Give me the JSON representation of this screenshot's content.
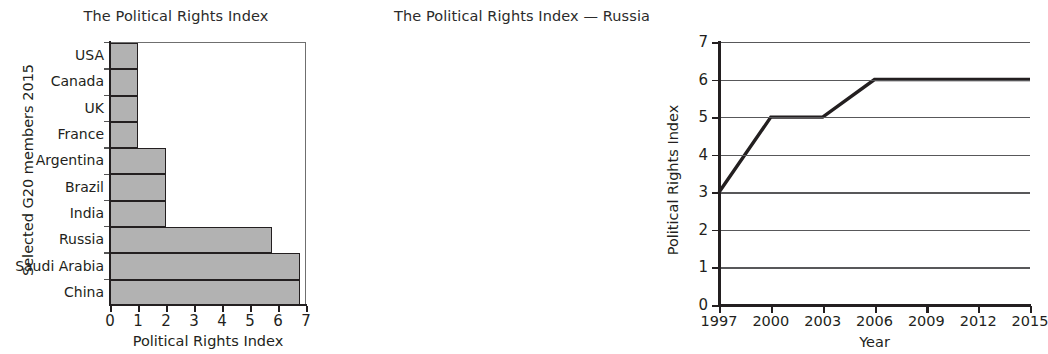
{
  "figure": {
    "background": "#ffffff",
    "ink_color": "#231f20",
    "bar_fill": "#b2b2b2",
    "gridline_color": "#58585a"
  },
  "chart_data": [
    {
      "type": "bar",
      "orientation": "horizontal",
      "title": "The Political Rights Index",
      "xlabel": "Political Rights Index",
      "ylabel": "Selected G20 members 2015",
      "categories": [
        "USA",
        "Canada",
        "UK",
        "France",
        "Argentina",
        "Brazil",
        "India",
        "Russia",
        "Saudi Arabia",
        "China"
      ],
      "values": [
        1,
        1,
        1,
        1,
        2,
        2,
        2,
        5.8,
        6.8,
        6.8
      ],
      "xlim": [
        0,
        7
      ],
      "xticks": [
        0,
        1,
        2,
        3,
        4,
        5,
        6,
        7
      ],
      "xtick_labels": [
        "0",
        "1",
        "2",
        "3",
        "4",
        "5",
        "6",
        "7"
      ],
      "grid": false,
      "legend": "none",
      "bar_fill_color": "#b2b2b2",
      "bar_edge_color": "#231f20"
    },
    {
      "type": "line",
      "title": "The Political Rights Index — Russia",
      "xlabel": "Year",
      "ylabel": "Political Rights Index",
      "series": [
        {
          "name": "Russia",
          "x": [
            1997,
            2000,
            2003,
            2006,
            2015
          ],
          "values": [
            3,
            5,
            5,
            6,
            6
          ]
        }
      ],
      "xlim": [
        1997,
        2015
      ],
      "ylim": [
        0,
        7
      ],
      "xticks": [
        1997,
        2000,
        2003,
        2006,
        2009,
        2012,
        2015
      ],
      "xtick_labels": [
        "1997",
        "2000",
        "2003",
        "2006",
        "2009",
        "2012",
        "2015"
      ],
      "yticks": [
        0,
        1,
        2,
        3,
        4,
        5,
        6,
        7
      ],
      "ytick_labels": [
        "0",
        "1",
        "2",
        "3",
        "4",
        "5",
        "6",
        "7"
      ],
      "grid": "horizontal",
      "legend": "none",
      "line_color": "#231f20",
      "line_width": 3.4
    }
  ]
}
